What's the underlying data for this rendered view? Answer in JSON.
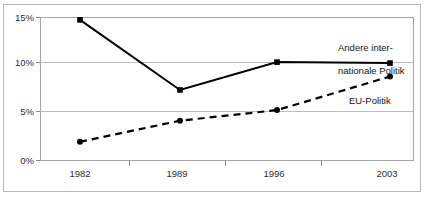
{
  "chart_data": {
    "type": "line",
    "title": "",
    "subtitle": "",
    "xlabel": "",
    "ylabel": "",
    "categories": [
      "1982",
      "1989",
      "1996",
      "2003"
    ],
    "x": [
      1982,
      1989,
      1996,
      2003
    ],
    "ylim": [
      0,
      15
    ],
    "yticks": [
      0,
      5,
      10,
      15
    ],
    "ytick_labels": [
      "0%",
      "5%",
      "10%",
      "15%"
    ],
    "grid": "horizontal",
    "legend_position": "inline-annotation",
    "series": [
      {
        "name": "Andere internationale Politik",
        "label_text": "Andere inter-\nnationale Politik",
        "style": "solid",
        "marker": "square",
        "color": "#000000",
        "values": [
          14.7,
          7.4,
          10.3,
          10.2
        ]
      },
      {
        "name": "EU-Politik",
        "label_text": "EU-Politik",
        "style": "dashed",
        "marker": "circle",
        "color": "#000000",
        "values": [
          2.0,
          4.2,
          5.3,
          8.8
        ]
      }
    ]
  },
  "axes": {
    "y_labels": [
      "15%",
      "10%",
      "5%",
      "0%"
    ],
    "x_labels": [
      "1982",
      "1989",
      "1996",
      "2003"
    ]
  },
  "annotations": {
    "other_line1": "Andere inter-",
    "other_line2": "nationale Politik",
    "eu": "EU-Politik"
  },
  "colors": {
    "series": "#000000",
    "grid": "#bdbdbd",
    "axis": "#a6a6a6",
    "frame": "#b9b9b9",
    "text": "#2e2e2e",
    "background": "#ffffff"
  }
}
